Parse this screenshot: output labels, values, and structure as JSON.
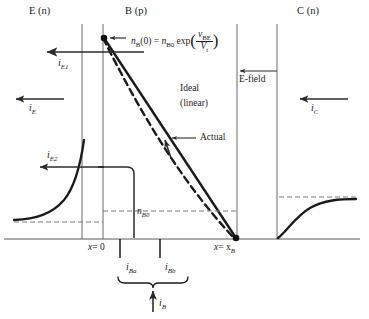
{
  "figure": {
    "title_regions": {
      "emitter": "E (n)",
      "base": "B (p)",
      "collector": "C (n)"
    },
    "equation": {
      "lhs_var": "n",
      "lhs_sub": "B",
      "lhs_arg": "(0)",
      "equals": "=",
      "rhs_var": "n",
      "rhs_sub": "B0",
      "exp_fn": "exp",
      "frac_num_var": "v",
      "frac_num_sub": "BE",
      "frac_den_var": "V",
      "frac_den_sub": "t",
      "full_text": "nB(0) = nB0 exp(vBE / Vt)"
    },
    "annotations": {
      "ideal_line1": "Ideal",
      "ideal_line2": "(linear)",
      "actual": "Actual",
      "efield": "E-field",
      "nb0": "n",
      "nb0_sub": "B0"
    },
    "axis_labels": {
      "x_zero_var": "x",
      "x_zero_eq": "= 0",
      "x_zero_full": "x = 0",
      "x_xb_var": "x",
      "x_xb_eq": "= x",
      "x_xb_sub": "B",
      "x_xb_full": "x = xB"
    },
    "currents": [
      {
        "name": "i",
        "sub": "E1",
        "id": "iE1"
      },
      {
        "name": "i",
        "sub": "E",
        "id": "iE"
      },
      {
        "name": "i",
        "sub": "E2",
        "id": "iE2"
      },
      {
        "name": "i",
        "sub": "C",
        "id": "iC"
      },
      {
        "name": "i",
        "sub": "Ba",
        "id": "iBa"
      },
      {
        "name": "i",
        "sub": "Bb",
        "id": "iBb"
      },
      {
        "name": "i",
        "sub": "B",
        "id": "iB"
      }
    ],
    "colors": {
      "line": "#1a1a1a",
      "axis": "#4d4d4d",
      "dashed": "#707070",
      "background": "#ffffff"
    }
  }
}
